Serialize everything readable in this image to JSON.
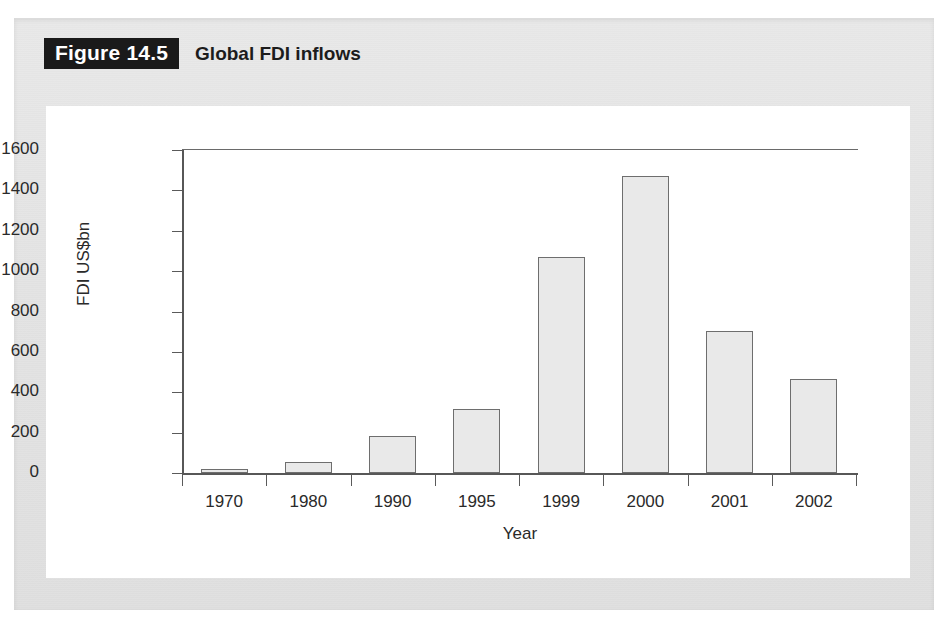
{
  "figure": {
    "badge_label": "Figure 14.5",
    "caption": "Global FDI inflows"
  },
  "colors": {
    "page_background": "#e4e4e4",
    "panel_background": "#ffffff",
    "bar_fill": "#e9e9e9",
    "bar_stroke": "#6e6e6e",
    "axis": "#575757",
    "badge_background": "#1a1a1a",
    "text": "#2a2a2a"
  },
  "chart_data": {
    "type": "bar",
    "title": "Global FDI inflows",
    "xlabel": "Year",
    "ylabel": "FDI US$bn",
    "categories": [
      "1970",
      "1980",
      "1990",
      "1995",
      "1999",
      "2000",
      "2001",
      "2002"
    ],
    "values": [
      20,
      55,
      185,
      315,
      1070,
      1470,
      705,
      465
    ],
    "ylim": [
      0,
      1600
    ],
    "yticks": [
      0,
      200,
      400,
      600,
      800,
      1000,
      1200,
      1400,
      1600
    ],
    "ytick_labels": [
      "0",
      "200",
      "400",
      "600",
      "800",
      "1000",
      "1200",
      "1400",
      "1600"
    ],
    "grid": false,
    "legend": null
  }
}
